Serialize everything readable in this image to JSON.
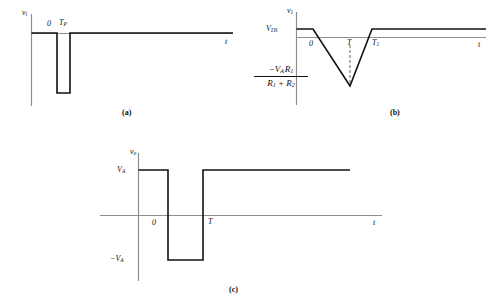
{
  "figure": {
    "background_color": "#ffffff",
    "line_color": "#111111",
    "axis_color": "#8e8e8e",
    "panels": [
      {
        "id": "a",
        "caption": "(a)",
        "y_axis_label": "v",
        "y_axis_sub": "i",
        "x_axis_label": "t",
        "tick_zero": "0",
        "tick_tp": "T",
        "tick_tp_sub": "P"
      },
      {
        "id": "b",
        "caption": "(b)",
        "y_axis_label": "v",
        "y_axis_sub": "1",
        "x_axis_label": "t",
        "level_label": "V",
        "level_sub": "DS",
        "tick_zero": "0",
        "tick_t": "T",
        "tick_t1": "T",
        "tick_t1_sub": "1",
        "min_numerator": "−V",
        "min_numerator_sub_a": "A",
        "min_numerator_r": "R",
        "min_numerator_sub_r": "1",
        "min_denominator_r1": "R",
        "min_denominator_sub_1": "1",
        "min_denominator_plus": "+",
        "min_denominator_r2": "R",
        "min_denominator_sub_2": "2"
      },
      {
        "id": "c",
        "caption": "(c)",
        "y_axis_label": "v",
        "y_axis_sub": "o",
        "x_axis_label": "t",
        "level_high": "V",
        "level_high_sub": "A",
        "level_low": "−V",
        "level_low_sub": "A",
        "tick_zero": "0",
        "tick_t": "T"
      }
    ]
  },
  "chart_data": [
    {
      "type": "line",
      "id": "a",
      "title": "(a)",
      "xlabel": "t",
      "ylabel": "v_i",
      "grid": false,
      "legend": "none",
      "xlim": [
        -0.25,
        10
      ],
      "ylim": [
        -1.15,
        0.45
      ],
      "tick_labels_x": [
        "0",
        "T_P"
      ],
      "tick_values_x": [
        0,
        0.62
      ],
      "series": [
        {
          "name": "v_i(t)",
          "x": [
            -0.25,
            0,
            0,
            0.62,
            0.62,
            10
          ],
          "y": [
            0,
            0,
            -1,
            -1,
            0,
            0
          ]
        }
      ],
      "annotations": [
        {
          "text": "0",
          "x": 0,
          "y": 0.18
        },
        {
          "text": "T_P",
          "x": 0.62,
          "y": 0.18
        }
      ]
    },
    {
      "type": "line",
      "id": "b",
      "title": "(b)",
      "xlabel": "t",
      "ylabel": "v_1",
      "grid": false,
      "legend": "none",
      "xlim": [
        -0.3,
        9
      ],
      "ylim": [
        -1.2,
        0.35
      ],
      "tick_labels_x": [
        "0",
        "T",
        "T_1"
      ],
      "tick_values_x": [
        0,
        1.05,
        1.7
      ],
      "tick_labels_y": [
        "V_DS",
        "-V_A*R_1/(R_1+R_2)"
      ],
      "tick_values_y": [
        0.12,
        -1.0
      ],
      "series": [
        {
          "name": "v_1(t)",
          "x": [
            -0.3,
            0.05,
            1.35,
            1.7,
            9
          ],
          "y": [
            0.12,
            0.12,
            -1.0,
            0.12,
            0.12
          ]
        }
      ],
      "annotations": [
        {
          "text": "0",
          "x": 0.08,
          "y": -0.12
        },
        {
          "text": "T",
          "x": 1.05,
          "y": -0.12
        },
        {
          "text": "T_1",
          "x": 1.78,
          "y": -0.12
        },
        {
          "text": "dashed marker at T",
          "x": 1.05,
          "y": -0.55
        }
      ]
    },
    {
      "type": "line",
      "id": "c",
      "title": "(c)",
      "xlabel": "t",
      "ylabel": "v_o",
      "grid": false,
      "legend": "none",
      "xlim": [
        -0.3,
        9
      ],
      "ylim": [
        -1.35,
        1.35
      ],
      "tick_labels_x": [
        "0",
        "T"
      ],
      "tick_values_x": [
        0,
        1.2
      ],
      "tick_labels_y": [
        "V_A",
        "-V_A"
      ],
      "tick_values_y": [
        1.0,
        -1.0
      ],
      "series": [
        {
          "name": "v_o(t)",
          "x": [
            -0.3,
            0.42,
            0.42,
            1.2,
            1.2,
            9
          ],
          "y": [
            1.0,
            1.0,
            -1.0,
            -1.0,
            1.0,
            1.0
          ]
        }
      ],
      "annotations": [
        {
          "text": "0",
          "x": 0.12,
          "y": -0.18
        },
        {
          "text": "T",
          "x": 1.28,
          "y": -0.18
        }
      ]
    }
  ]
}
